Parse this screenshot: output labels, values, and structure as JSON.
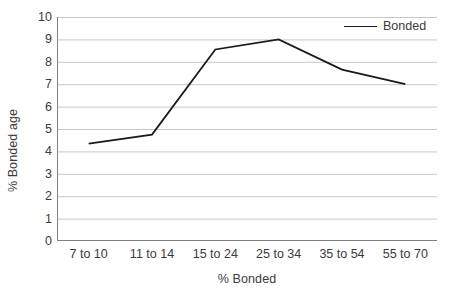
{
  "chart_data": {
    "type": "line",
    "title": "",
    "xlabel": "% Bonded",
    "ylabel": "% Bonded age",
    "categories": [
      "7 to 10",
      "11 to 14",
      "15 to 24",
      "25 to 34",
      "35 to 54",
      "55 to 70"
    ],
    "series": [
      {
        "name": "Bonded",
        "values": [
          4.35,
          4.75,
          8.55,
          9.0,
          7.65,
          7.0
        ],
        "color": "#1a1a1a"
      }
    ],
    "ylim": [
      0,
      10
    ],
    "y_ticks": [
      "0",
      "1",
      "2",
      "3",
      "4",
      "5",
      "6",
      "7",
      "8",
      "9",
      "10"
    ],
    "grid": "horizontal",
    "legend_position": "top-right",
    "legend_entries": [
      "Bonded"
    ],
    "axis_color": "#808080",
    "grid_color": "#c8c8c8",
    "background": "#ffffff"
  }
}
